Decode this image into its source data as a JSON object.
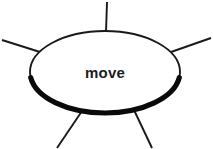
{
  "diagram": {
    "title": "move",
    "type": "node-with-connectors",
    "canvas": {
      "width": 213,
      "height": 149,
      "background": "#ffffff"
    },
    "node": {
      "label": "move",
      "shape": "ellipse",
      "center_x": 105,
      "center_y": 72,
      "radius_x": 75,
      "radius_y": 41,
      "fill_color": "#ffffff",
      "stroke_color": "#1a1a1a",
      "stroke_width": 1.9,
      "label_color": "#1c1c1c",
      "label_font_size": 15,
      "label_font_weight": "bold",
      "has_drop_shadow": true,
      "shadow_color": "#0a0a0a",
      "shadow_stroke_width": 5.2,
      "shadow_arc_start_deg": 8,
      "shadow_arc_end_deg": 172
    },
    "connectors": [
      {
        "name": "connector-top",
        "direction": "up",
        "x1": 107,
        "y1": 2,
        "x2": 106,
        "y2": 32,
        "stroke_color": "#1a1a1a",
        "stroke_width": 1.9
      },
      {
        "name": "connector-upper-left",
        "direction": "upper-left",
        "x1": 2,
        "y1": 40,
        "x2": 40,
        "y2": 52,
        "stroke_color": "#1a1a1a",
        "stroke_width": 1.9
      },
      {
        "name": "connector-upper-right",
        "direction": "upper-right",
        "x1": 211,
        "y1": 38,
        "x2": 171,
        "y2": 52,
        "stroke_color": "#1a1a1a",
        "stroke_width": 1.9
      },
      {
        "name": "connector-lower-left",
        "direction": "lower-left",
        "x1": 82,
        "y1": 111,
        "x2": 57,
        "y2": 148,
        "stroke_color": "#1a1a1a",
        "stroke_width": 1.9
      },
      {
        "name": "connector-lower-right",
        "direction": "lower-right",
        "x1": 134,
        "y1": 110,
        "x2": 152,
        "y2": 148,
        "stroke_color": "#1a1a1a",
        "stroke_width": 1.9
      }
    ]
  }
}
